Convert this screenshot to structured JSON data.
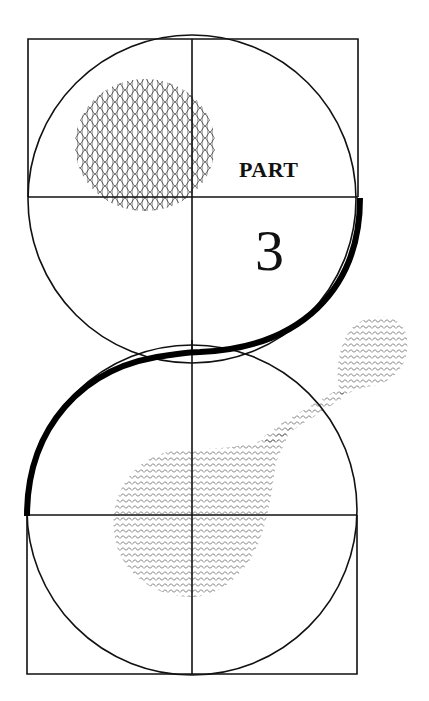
{
  "title": {
    "label": "PART",
    "number": "3"
  },
  "colors": {
    "background": "#ffffff",
    "ink": "#111111",
    "hatch": "#444444"
  },
  "figure": {
    "top_pattern": "wavy-mesh",
    "bottom_pattern": "zigzag-chevron",
    "satellite_pattern": "zigzag-chevron"
  }
}
